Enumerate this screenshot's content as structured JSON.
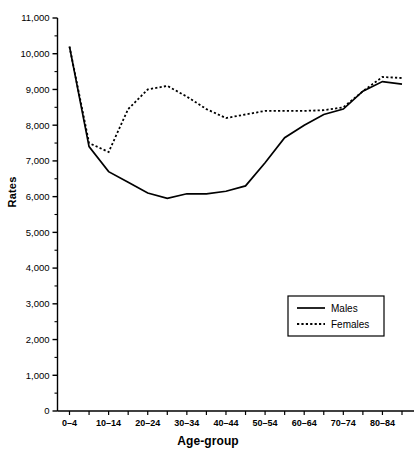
{
  "chart_data": {
    "type": "line",
    "title": "",
    "xlabel": "Age-group",
    "ylabel": "Rates",
    "ylim": [
      0,
      11000
    ],
    "ytick_values": [
      0,
      1000,
      2000,
      3000,
      4000,
      5000,
      6000,
      7000,
      8000,
      9000,
      10000,
      11000
    ],
    "ytick_labels": [
      "0",
      "1,000",
      "2,000",
      "3,000",
      "4,000",
      "5,000",
      "6,000",
      "7,000",
      "8,000",
      "9,000",
      "10,000",
      "11,000"
    ],
    "yminor_step": 500,
    "grid": false,
    "legend_position": "lower-right",
    "categories": [
      "0–4",
      "5–9",
      "10–14",
      "15–19",
      "20–24",
      "25–29",
      "30–34",
      "35–39",
      "40–44",
      "45–49",
      "50–54",
      "55–59",
      "60–64",
      "65–69",
      "70–74",
      "75–79",
      "80–84",
      "85+"
    ],
    "xtick_labels_shown": [
      "0–4",
      "10–14",
      "20–24",
      "30–34",
      "40–44",
      "50–54",
      "60–64",
      "70–74",
      "80–84"
    ],
    "series": [
      {
        "name": "Males",
        "style": "solid",
        "color": "#000000",
        "values": [
          10200,
          7400,
          6700,
          6400,
          6100,
          5950,
          6080,
          6080,
          6150,
          6300,
          6950,
          7650,
          8000,
          8300,
          8450,
          8950,
          9220,
          9150
        ]
      },
      {
        "name": "Females",
        "style": "dotted",
        "color": "#000000",
        "values": [
          10200,
          7500,
          7250,
          8450,
          9000,
          9100,
          8800,
          8450,
          8200,
          8300,
          8400,
          8400,
          8400,
          8420,
          8500,
          8950,
          9350,
          9320
        ]
      }
    ]
  },
  "legend": {
    "entries": [
      {
        "label": "Males",
        "style": "solid"
      },
      {
        "label": "Females",
        "style": "dotted"
      }
    ]
  },
  "axes": {
    "y_title": "Rates",
    "x_title": "Age-group"
  }
}
